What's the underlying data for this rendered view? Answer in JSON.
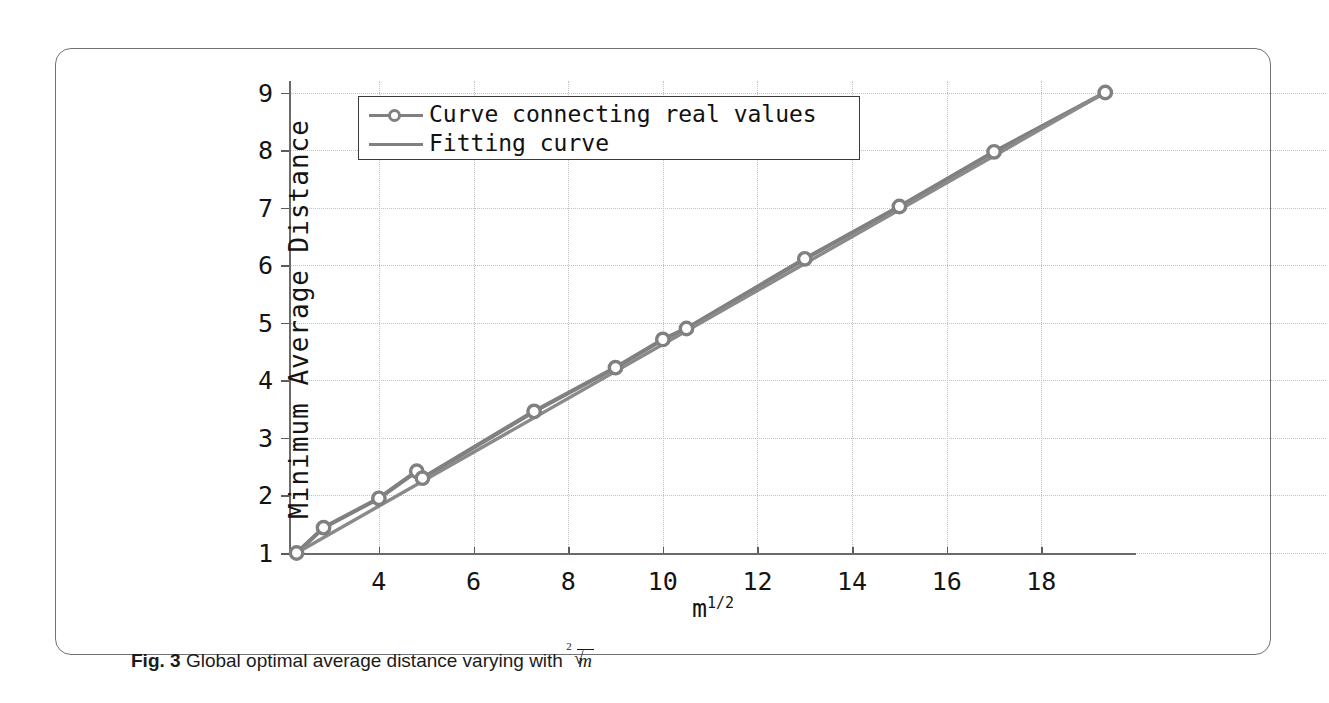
{
  "figure": {
    "caption_prefix": "Fig. 3",
    "caption_text": "Global optimal average distance varying with",
    "caption_math_index": "2",
    "caption_math_radicand": "m"
  },
  "legend": {
    "position": "top-left-inside",
    "items": [
      {
        "label": "Curve connecting real values",
        "style": "line-with-markers",
        "color": "#808080"
      },
      {
        "label": "Fitting curve",
        "style": "line",
        "color": "#808080"
      }
    ]
  },
  "colors": {
    "series": "#808080",
    "fit": "#8a8a8a",
    "axis": "#6a6a6a",
    "grid": "#c2c2c2",
    "text": "#141414",
    "card_border": "#6f7377"
  },
  "chart_data": {
    "type": "line",
    "title": "",
    "xlabel": "m^1/2",
    "xlabel_base": "m",
    "xlabel_exponent": "1/2",
    "ylabel": "Minimum Average Distance",
    "xlim": [
      2.1,
      20.0
    ],
    "ylim": [
      1.0,
      9.2
    ],
    "xticks": [
      4,
      6,
      8,
      10,
      12,
      14,
      16,
      18
    ],
    "yticks": [
      1,
      2,
      3,
      4,
      5,
      6,
      7,
      8,
      9
    ],
    "grid": true,
    "grid_style": "dotted",
    "series": [
      {
        "name": "Curve connecting real values",
        "markers": true,
        "x": [
          2.26,
          2.83,
          4.0,
          4.8,
          4.92,
          7.28,
          9.0,
          10.0,
          10.5,
          13.0,
          15.0,
          17.0,
          19.35
        ],
        "y": [
          1.0,
          1.44,
          1.95,
          2.42,
          2.3,
          3.46,
          4.22,
          4.71,
          4.9,
          6.11,
          7.02,
          7.97,
          9.0
        ]
      },
      {
        "name": "Fitting curve",
        "markers": false,
        "x": [
          2.26,
          19.35
        ],
        "y": [
          1.0,
          9.0
        ]
      }
    ]
  }
}
